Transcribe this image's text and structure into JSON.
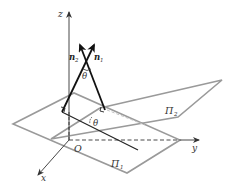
{
  "diagram": {
    "axes": {
      "x_label": "x",
      "y_label": "y",
      "z_label": "z",
      "origin_label": "O"
    },
    "planes": [
      {
        "name": "Π1",
        "label": "Π",
        "subscript": "1"
      },
      {
        "name": "Π2",
        "label": "Π",
        "subscript": "2"
      }
    ],
    "normals": [
      {
        "name": "n1",
        "label": "n",
        "subscript": "1"
      },
      {
        "name": "n2",
        "label": "n",
        "subscript": "2"
      }
    ],
    "angles": [
      {
        "name": "theta-between-normals",
        "label": "θ"
      },
      {
        "name": "theta-between-planes",
        "label": "θ"
      }
    ],
    "colors": {
      "plane_edge": "#9a9a9a",
      "axis": "#333333",
      "normal": "#222222",
      "hidden_edge": "#bdbdbd"
    }
  }
}
